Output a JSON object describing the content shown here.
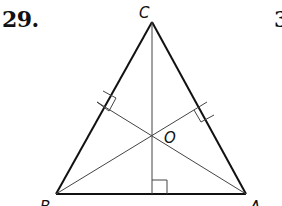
{
  "problem": {
    "number": "29.",
    "next_number_partial": "3"
  },
  "figure": {
    "type": "triangle with altitudes meeting at orthocenter",
    "vertices": {
      "C": {
        "label": "C"
      },
      "B": {
        "label": "B"
      },
      "A": {
        "label": "A"
      }
    },
    "intersection": {
      "label": "O"
    },
    "right_angle_marks": 3,
    "colors": {
      "sides": "#111111",
      "altitudes": "#444444"
    }
  }
}
